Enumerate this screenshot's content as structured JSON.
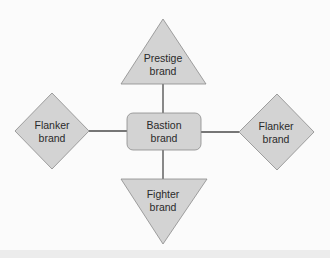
{
  "diagram": {
    "colors": {
      "background": "#fbfbfb",
      "shape_fill": "#d3d3d3",
      "shape_stroke": "#8a8a8a",
      "connector": "#4a4a4a",
      "text": "#2a2a2a"
    },
    "center": {
      "line1": "Bastion",
      "line2": "brand",
      "shape": "rounded-rectangle"
    },
    "top": {
      "line1": "Prestige",
      "line2": "brand",
      "shape": "triangle-up"
    },
    "bottom": {
      "line1": "Fighter",
      "line2": "brand",
      "shape": "triangle-down"
    },
    "left": {
      "line1": "Flanker",
      "line2": "brand",
      "shape": "diamond"
    },
    "right": {
      "line1": "Flanker",
      "line2": "brand",
      "shape": "diamond"
    }
  }
}
